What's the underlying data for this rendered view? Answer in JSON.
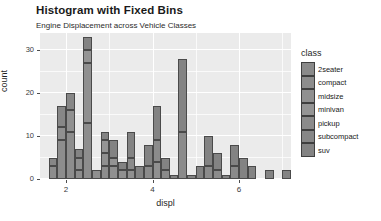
{
  "chart_data": {
    "type": "bar",
    "subtype": "stacked-histogram",
    "title": "Histogram with Fixed Bins",
    "subtitle": "Engine Displacement across Vehicle Classes",
    "xlabel": "displ",
    "ylabel": "count",
    "xlim": [
      1.4,
      7.2
    ],
    "ylim": [
      0,
      34
    ],
    "xticks": [
      "2",
      "4",
      "6"
    ],
    "xtick_values": [
      2,
      4,
      6
    ],
    "yticks": [
      "0",
      "10",
      "20",
      "30"
    ],
    "ytick_values": [
      0,
      10,
      20,
      30
    ],
    "grid": true,
    "grid_color": "#ffffff",
    "panel_background": "#ebebeb",
    "legend": {
      "title": "class",
      "position": "right",
      "entries": [
        {
          "label": "2seater",
          "color": "#8a8a8a"
        },
        {
          "label": "compact",
          "color": "#8d8d8d"
        },
        {
          "label": "midsize",
          "color": "#909090"
        },
        {
          "label": "minivan",
          "color": "#949494"
        },
        {
          "label": "pickup",
          "color": "#8b8b8b"
        },
        {
          "label": "subcompact",
          "color": "#878787"
        },
        {
          "label": "suv",
          "color": "#838383"
        }
      ]
    },
    "bin_width": 0.2,
    "bins": [
      {
        "x0": 1.6,
        "total": 5,
        "segments": [
          {
            "class": "compact",
            "value": 3
          },
          {
            "class": "subcompact",
            "value": 2
          }
        ]
      },
      {
        "x0": 1.8,
        "total": 17,
        "segments": [
          {
            "class": "compact",
            "value": 9
          },
          {
            "class": "midsize",
            "value": 3
          },
          {
            "class": "subcompact",
            "value": 5
          }
        ]
      },
      {
        "x0": 2.0,
        "total": 20,
        "segments": [
          {
            "class": "compact",
            "value": 11
          },
          {
            "class": "midsize",
            "value": 5
          },
          {
            "class": "subcompact",
            "value": 4
          }
        ]
      },
      {
        "x0": 2.2,
        "total": 7,
        "segments": [
          {
            "class": "compact",
            "value": 2
          },
          {
            "class": "midsize",
            "value": 3
          },
          {
            "class": "suv",
            "value": 2
          }
        ]
      },
      {
        "x0": 2.4,
        "total": 33,
        "segments": [
          {
            "class": "compact",
            "value": 13
          },
          {
            "class": "midsize",
            "value": 14
          },
          {
            "class": "minivan",
            "value": 3
          },
          {
            "class": "suv",
            "value": 3
          }
        ]
      },
      {
        "x0": 2.6,
        "total": 2,
        "segments": [
          {
            "class": "midsize",
            "value": 2
          }
        ]
      },
      {
        "x0": 2.8,
        "total": 11,
        "segments": [
          {
            "class": "compact",
            "value": 3
          },
          {
            "class": "midsize",
            "value": 3
          },
          {
            "class": "minivan",
            "value": 3
          },
          {
            "class": "suv",
            "value": 2
          }
        ]
      },
      {
        "x0": 3.0,
        "total": 9,
        "segments": [
          {
            "class": "midsize",
            "value": 3
          },
          {
            "class": "minivan",
            "value": 2
          },
          {
            "class": "suv",
            "value": 4
          }
        ]
      },
      {
        "x0": 3.2,
        "total": 4,
        "segments": [
          {
            "class": "midsize",
            "value": 2
          },
          {
            "class": "suv",
            "value": 2
          }
        ]
      },
      {
        "x0": 3.4,
        "total": 11,
        "segments": [
          {
            "class": "midsize",
            "value": 2
          },
          {
            "class": "pickup",
            "value": 3
          },
          {
            "class": "suv",
            "value": 6
          }
        ]
      },
      {
        "x0": 3.6,
        "total": 3,
        "segments": [
          {
            "class": "suv",
            "value": 3
          }
        ]
      },
      {
        "x0": 3.8,
        "total": 8,
        "segments": [
          {
            "class": "pickup",
            "value": 3
          },
          {
            "class": "suv",
            "value": 5
          }
        ]
      },
      {
        "x0": 4.0,
        "total": 17,
        "segments": [
          {
            "class": "midsize",
            "value": 4
          },
          {
            "class": "pickup",
            "value": 5
          },
          {
            "class": "suv",
            "value": 8
          }
        ]
      },
      {
        "x0": 4.2,
        "total": 5,
        "segments": [
          {
            "class": "pickup",
            "value": 2
          },
          {
            "class": "suv",
            "value": 3
          }
        ]
      },
      {
        "x0": 4.4,
        "total": 1,
        "segments": [
          {
            "class": "suv",
            "value": 1
          }
        ]
      },
      {
        "x0": 4.6,
        "total": 28,
        "segments": [
          {
            "class": "pickup",
            "value": 11
          },
          {
            "class": "suv",
            "value": 17
          }
        ]
      },
      {
        "x0": 4.8,
        "total": 1,
        "segments": [
          {
            "class": "suv",
            "value": 1
          }
        ]
      },
      {
        "x0": 5.0,
        "total": 3,
        "segments": [
          {
            "class": "suv",
            "value": 3
          }
        ]
      },
      {
        "x0": 5.2,
        "total": 10,
        "segments": [
          {
            "class": "pickup",
            "value": 3
          },
          {
            "class": "suv",
            "value": 7
          }
        ]
      },
      {
        "x0": 5.4,
        "total": 6,
        "segments": [
          {
            "class": "pickup",
            "value": 2
          },
          {
            "class": "suv",
            "value": 4
          }
        ]
      },
      {
        "x0": 5.6,
        "total": 1,
        "segments": [
          {
            "class": "suv",
            "value": 1
          }
        ]
      },
      {
        "x0": 5.8,
        "total": 8,
        "segments": [
          {
            "class": "2seater",
            "value": 3
          },
          {
            "class": "suv",
            "value": 5
          }
        ]
      },
      {
        "x0": 6.0,
        "total": 5,
        "segments": [
          {
            "class": "suv",
            "value": 5
          }
        ]
      },
      {
        "x0": 6.2,
        "total": 3,
        "segments": [
          {
            "class": "suv",
            "value": 3
          }
        ]
      },
      {
        "x0": 6.6,
        "total": 2,
        "segments": [
          {
            "class": "suv",
            "value": 2
          }
        ]
      },
      {
        "x0": 7.0,
        "total": 2,
        "segments": [
          {
            "class": "suv",
            "value": 2
          }
        ]
      }
    ]
  }
}
